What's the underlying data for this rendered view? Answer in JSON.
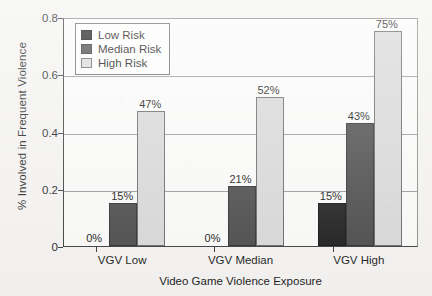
{
  "chart_data": {
    "type": "bar",
    "title": "",
    "xlabel": "Video Game Violence Exposure",
    "ylabel": "% Involved in Frequent Violence",
    "categories": [
      "VGV Low",
      "VGV Median",
      "VGV High"
    ],
    "series": [
      {
        "name": "Low Risk",
        "color": "#1d1d1d",
        "values": [
          0.0,
          0.0,
          0.15
        ],
        "labels": [
          "0%",
          "0%",
          "15%"
        ]
      },
      {
        "name": "Median Risk",
        "color": "#4a4a4a",
        "values": [
          0.15,
          0.21,
          0.43
        ],
        "labels": [
          "15%",
          "21%",
          "43%"
        ]
      },
      {
        "name": "High Risk",
        "color": "#d9d9d9",
        "values": [
          0.47,
          0.52,
          0.75
        ],
        "labels": [
          "47%",
          "52%",
          "75%"
        ]
      }
    ],
    "ylim": [
      0,
      0.8
    ],
    "yticks": [
      0,
      0.2,
      0.4,
      0.6,
      0.8
    ],
    "ytick_labels": [
      "0",
      "0.2",
      "0.4",
      "0.6",
      "0.8"
    ],
    "gridlines": [
      0.2,
      0.4,
      0.6
    ],
    "grid": true,
    "legend_position": "top-left",
    "value_labels_shown": true
  }
}
